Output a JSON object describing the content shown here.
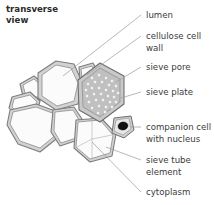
{
  "figure": {
    "title_line1": "transverse",
    "title_line2": "view",
    "colors": {
      "background": "#ffffff",
      "cell_wall": "#d2d2d2",
      "cell_wall_stroke": "#7d7d7d",
      "lumen_fill": "#fbfbfb",
      "sieve_plate": "#c0c0c0",
      "sieve_pore": "#f2f2f2",
      "nucleus": "#121212",
      "leader_line": "#9a9a9a",
      "label_text": "#3b3b3b",
      "title_text": "#2b2b2b"
    }
  },
  "labels": [
    {
      "id": "lumen",
      "text": "lumen",
      "lines": [
        "lumen"
      ]
    },
    {
      "id": "cellulose-cell-wall",
      "text": "cellulose cell wall",
      "lines": [
        "cellulose cell",
        "wall"
      ]
    },
    {
      "id": "sieve-pore",
      "text": "sieve pore",
      "lines": [
        "sieve pore"
      ]
    },
    {
      "id": "sieve-plate",
      "text": "sieve plate",
      "lines": [
        "sieve plate"
      ]
    },
    {
      "id": "companion-cell-with-nucleus",
      "text": "companion cell with nucleus",
      "lines": [
        "companion cell",
        "with nucleus"
      ]
    },
    {
      "id": "sieve-tube-element",
      "text": "sieve tube element",
      "lines": [
        "sieve tube",
        "element"
      ]
    },
    {
      "id": "cytoplasm",
      "text": "cytoplasm",
      "lines": [
        "cytoplasm"
      ]
    }
  ]
}
